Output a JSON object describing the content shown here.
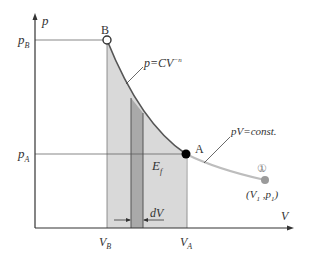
{
  "diagram": {
    "type": "p-V compression diagram",
    "axes": {
      "y_label": "p",
      "x_label": "V",
      "y_ticks": [
        {
          "label": "p_B",
          "main": "p",
          "sub": "B"
        },
        {
          "label": "p_A",
          "main": "p",
          "sub": "A"
        }
      ],
      "x_ticks": [
        {
          "label": "V_B",
          "main": "V",
          "sub": "B"
        },
        {
          "label": "V_A",
          "main": "V",
          "sub": "A"
        }
      ]
    },
    "points": {
      "B": {
        "label": "B",
        "style": "open circle"
      },
      "A": {
        "label": "A",
        "style": "filled black circle"
      },
      "one": {
        "label": "①",
        "coord_text": "(V",
        "coord_sub1": "1",
        "coord_mid": " ,p",
        "coord_sub2": "1",
        "coord_end": ")",
        "style": "filled gray circle"
      }
    },
    "curves": {
      "polytropic": {
        "label_main": "p=CV",
        "label_exp": "−n"
      },
      "isotherm": {
        "label": "pV=const."
      }
    },
    "area": {
      "label_main": "E",
      "label_sub": "f"
    },
    "strip": {
      "label": "dV"
    },
    "colors": {
      "area_fill": "#d9d9d9",
      "strip_fill": "#a8a8a8",
      "curve_dark": "#555555",
      "curve_light": "#bbbbbb",
      "axis": "#333333",
      "point_one": "#9a9a9a"
    }
  }
}
